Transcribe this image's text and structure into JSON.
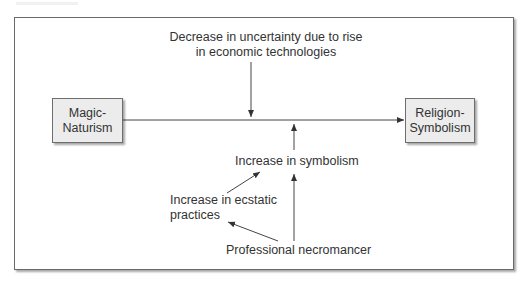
{
  "diagram": {
    "nodes": {
      "magic_naturism": {
        "line1": "Magic-",
        "line2": "Naturism"
      },
      "religion_symbolism": {
        "line1": "Religion-",
        "line2": "Symbolism"
      }
    },
    "labels": {
      "decrease_uncertainty": {
        "line1": "Decrease in uncertainty due to rise",
        "line2": "in economic technologies"
      },
      "increase_symbolism": "Increase in symbolism",
      "increase_ecstatic": {
        "line1": "Increase in ecstatic",
        "line2": "practices"
      },
      "professional_necromancer": "Professional necromancer"
    },
    "edges": [
      {
        "from": "Magic-Naturism",
        "to": "Religion-Symbolism"
      },
      {
        "from": "Decrease in uncertainty due to rise in economic technologies",
        "to": "Magic-Naturism → Religion-Symbolism link"
      },
      {
        "from": "Increase in symbolism",
        "to": "Magic-Naturism → Religion-Symbolism link"
      },
      {
        "from": "Increase in ecstatic practices",
        "to": "Increase in symbolism"
      },
      {
        "from": "Professional necromancer",
        "to": "Increase in symbolism"
      },
      {
        "from": "Professional necromancer",
        "to": "Increase in ecstatic practices"
      }
    ],
    "colors": {
      "box_fill": "#ececec",
      "box_border": "#6e6e6e",
      "line": "#333333",
      "text": "#333333"
    }
  }
}
